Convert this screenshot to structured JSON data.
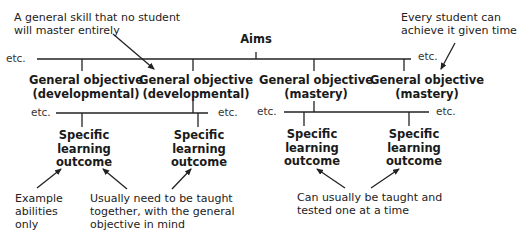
{
  "title": "Aims",
  "annotations": {
    "top_left": [
      "A general skill that no student",
      "will master entirely"
    ],
    "top_right": [
      "Every student can",
      "achieve it given time"
    ],
    "bottom_left": [
      "Example",
      "abilities",
      "only"
    ],
    "bottom_middle": [
      "Usually need to be taught",
      "together, with the general",
      "objective in mind"
    ],
    "bottom_right": [
      "Can usually be taught and",
      "tested one at a time"
    ]
  },
  "etc_label": "etc.",
  "general_objectives": [
    {
      "line1": "General objective",
      "line2": "(developmental)"
    },
    {
      "line1": "General objective",
      "line2": "(developmental)"
    },
    {
      "line1": "General objective",
      "line2": "(mastery)"
    },
    {
      "line1": "General objective",
      "line2": "(mastery)"
    }
  ],
  "specific_outcomes": [
    {
      "line1": "Specific",
      "line2": "learning",
      "line3": "outcome"
    },
    {
      "line1": "Specific",
      "line2": "learning",
      "line3": "outcome"
    },
    {
      "line1": "Specific",
      "line2": "learning",
      "line3": "outcome"
    },
    {
      "line1": "Specific",
      "line2": "learning",
      "line3": "outcome"
    }
  ],
  "colors": {
    "line": "#222222",
    "text": "#1a1a1a",
    "background": "#ffffff"
  }
}
